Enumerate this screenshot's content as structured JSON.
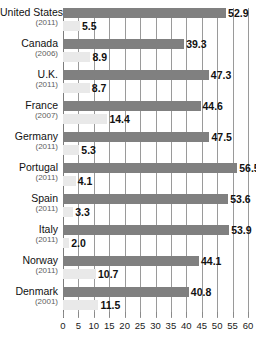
{
  "chart_data": {
    "type": "bar",
    "orientation": "horizontal",
    "title": "",
    "xlabel": "",
    "ylabel": "",
    "xlim": [
      0,
      60
    ],
    "grid": true,
    "grid_axis": "x",
    "legend": null,
    "tick_step": 5,
    "xticks": [
      "0",
      "5",
      "10",
      "15",
      "20",
      "25",
      "30",
      "35",
      "40",
      "45",
      "50",
      "55",
      "60"
    ],
    "xtick_values": [
      0,
      5,
      10,
      15,
      20,
      25,
      30,
      35,
      40,
      45,
      50,
      55,
      60
    ],
    "categories": [
      "United States",
      "Canada",
      "U.K.",
      "France",
      "Germany",
      "Portugal",
      "Spain",
      "Italy",
      "Norway",
      "Denmark"
    ],
    "category_years": [
      "(2011)",
      "(2006)",
      "(2011)",
      "(2007)",
      "(2011)",
      "(2011)",
      "(2011)",
      "(2011)",
      "(2011)",
      "(2001)"
    ],
    "series": [
      {
        "name": "upper",
        "color": "#808080",
        "values": [
          52.9,
          39.3,
          47.3,
          44.6,
          47.5,
          56.5,
          53.6,
          53.9,
          44.1,
          40.8
        ],
        "labels": [
          "52.9",
          "39.3",
          "47.3",
          "44.6",
          "47.5",
          "56.5",
          "53.6",
          "53.9",
          "44.1",
          "40.8"
        ]
      },
      {
        "name": "lower",
        "color": "#e9e9e9",
        "values": [
          5.5,
          8.9,
          8.7,
          14.4,
          5.3,
          4.1,
          3.3,
          2.0,
          10.7,
          11.5
        ],
        "labels": [
          "5.5",
          "8.9",
          "8.7",
          "14.4",
          "5.3",
          "4.1",
          "3.3",
          "2.0",
          "10.7",
          "11.5"
        ]
      }
    ]
  },
  "colors": {
    "upper_bar": "#808080",
    "lower_bar": "#e9e9e9",
    "gridline": "#9a9a9a",
    "text": "#111111",
    "year_text": "#5d5d5d",
    "background": "#ffffff"
  }
}
